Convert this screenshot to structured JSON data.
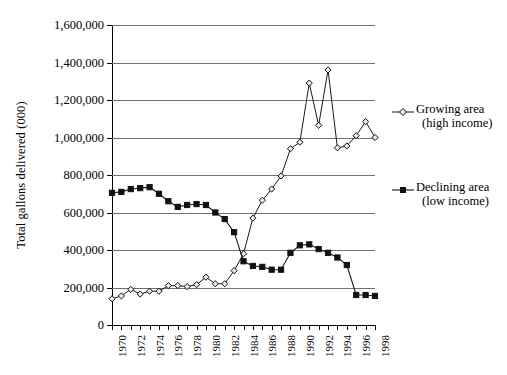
{
  "chart_data": {
    "type": "line",
    "title": "",
    "xlabel": "",
    "ylabel": "Total gallons delivered (000)",
    "ylim": [
      0,
      1600000
    ],
    "ytick_labels": [
      "1,600,000",
      "1,400,000",
      "1,200,000",
      "1,000,000",
      "800,000",
      "600,000",
      "400,000",
      "200,000",
      "0"
    ],
    "ytick_values": [
      1600000,
      1400000,
      1200000,
      1000000,
      800000,
      600000,
      400000,
      200000,
      0
    ],
    "grid": "horizontal",
    "legend_position": "right",
    "xlim": [
      1970,
      1998
    ],
    "x": [
      1970,
      1971,
      1972,
      1973,
      1974,
      1975,
      1976,
      1977,
      1978,
      1979,
      1980,
      1981,
      1982,
      1983,
      1984,
      1985,
      1986,
      1987,
      1988,
      1989,
      1990,
      1991,
      1992,
      1993,
      1994,
      1995,
      1996,
      1997,
      1998
    ],
    "xtick_labels": [
      "1970",
      "1972",
      "1974",
      "1976",
      "1978",
      "1980",
      "1982",
      "1984",
      "1986",
      "1988",
      "1990",
      "1992",
      "1994",
      "1996",
      "1998"
    ],
    "xtick_values": [
      1970,
      1972,
      1974,
      1976,
      1978,
      1980,
      1982,
      1984,
      1986,
      1988,
      1990,
      1992,
      1994,
      1996,
      1998
    ],
    "series": [
      {
        "name": "Growing area (high income)",
        "marker": "open-diamond",
        "values": [
          140000,
          155000,
          190000,
          165000,
          180000,
          180000,
          210000,
          210000,
          205000,
          215000,
          255000,
          220000,
          220000,
          290000,
          380000,
          570000,
          665000,
          725000,
          795000,
          940000,
          975000,
          1290000,
          1065000,
          1360000,
          945000,
          955000,
          1010000,
          1085000,
          1000000
        ]
      },
      {
        "name": "Declining area (low income)",
        "marker": "filled-square",
        "values": [
          705000,
          710000,
          725000,
          730000,
          735000,
          700000,
          660000,
          630000,
          640000,
          645000,
          640000,
          600000,
          565000,
          495000,
          340000,
          315000,
          310000,
          295000,
          295000,
          385000,
          425000,
          430000,
          405000,
          385000,
          360000,
          320000,
          160000,
          160000,
          155000
        ]
      }
    ]
  },
  "legend": {
    "entries": [
      {
        "line1": "Growing area",
        "line2": "(high income)"
      },
      {
        "line1": "Declining area",
        "line2": "(low income)"
      }
    ]
  }
}
